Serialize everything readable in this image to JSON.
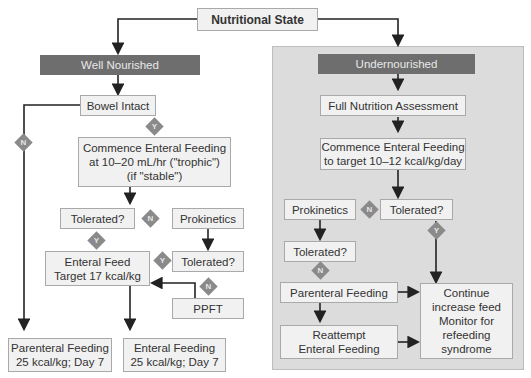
{
  "title": "Nutritional State",
  "left": {
    "header": "Well Nourished",
    "bowel": "Bowel Intact",
    "commence": "Commence Enteral Feeding\nat 10–20 mL/hr (\"trophic\")\n(if \"stable\")",
    "tolerated1": "Tolerated?",
    "prokinetics": "Prokinetics",
    "tolerated2": "Tolerated?",
    "enteral_target": "Enteral Feed\nTarget 17 kcal/kg",
    "ppft": "PPFT",
    "parenteral_day7": "Parenteral Feeding\n25 kcal/kg; Day 7",
    "enteral_day7": "Enteral Feeding\n25 kcal/kg; Day 7"
  },
  "right": {
    "header": "Undernourished",
    "assessment": "Full Nutrition Assessment",
    "commence": "Commence Enteral Feeding\nto target 10–12 kcal/kg/day",
    "tolerated1": "Tolerated?",
    "prokinetics": "Prokinetics",
    "tolerated2": "Tolerated?",
    "parenteral": "Parenteral Feeding",
    "reattempt": "Reattempt\nEnteral Feeding",
    "continue": "Continue\nincrease feed\nMonitor for\nrefeeding\nsyndrome"
  },
  "decisions": {
    "yes": "Y",
    "no": "N"
  },
  "colors": {
    "header_bg": "#6e6e6e",
    "panel_bg": "#dcdcdc",
    "box_bg": "#f1f1f1",
    "diamond": "#8a8a8a"
  }
}
